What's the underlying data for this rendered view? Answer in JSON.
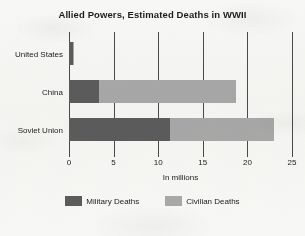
{
  "chart_data": {
    "type": "bar",
    "orientation": "horizontal",
    "stacked": true,
    "title": "Allied Powers, Estimated Deaths in WWII",
    "xlabel": "In millions",
    "ylabel": "",
    "xlim": [
      0,
      25
    ],
    "xticks": [
      0,
      5,
      10,
      15,
      20,
      25
    ],
    "xticklabels": [
      "0",
      "5",
      "10",
      "15",
      "20",
      "25"
    ],
    "grid": "vertical",
    "legend_position": "bottom",
    "categories": [
      "United States",
      "China",
      "Soviet Union"
    ],
    "series": [
      {
        "name": "Military Deaths",
        "color": "#5c5c5c",
        "values": [
          0.4,
          3.4,
          11.3
        ]
      },
      {
        "name": "Civilian Deaths",
        "color": "#a9a9a9",
        "values": [
          0.1,
          15.3,
          11.7
        ]
      }
    ],
    "totals": [
      0.5,
      18.7,
      23.0
    ]
  },
  "title": {
    "text": "Allied Powers, Estimated Deaths in WWII"
  },
  "axis": {
    "x_title": "In millions",
    "ticks": [
      {
        "value": 0,
        "label": "0"
      },
      {
        "value": 5,
        "label": "5"
      },
      {
        "value": 10,
        "label": "10"
      },
      {
        "value": 15,
        "label": "15"
      },
      {
        "value": 20,
        "label": "20"
      },
      {
        "value": 25,
        "label": "25"
      }
    ]
  },
  "rows": [
    {
      "category": "United States",
      "military": 0.4,
      "civilian": 0.1
    },
    {
      "category": "China",
      "military": 3.4,
      "civilian": 15.3
    },
    {
      "category": "Soviet Union",
      "military": 11.3,
      "civilian": 11.7
    }
  ],
  "legend": {
    "items": [
      {
        "label": "Military Deaths",
        "color": "#5c5c5c"
      },
      {
        "label": "Civilian Deaths",
        "color": "#a9a9a9"
      }
    ]
  }
}
